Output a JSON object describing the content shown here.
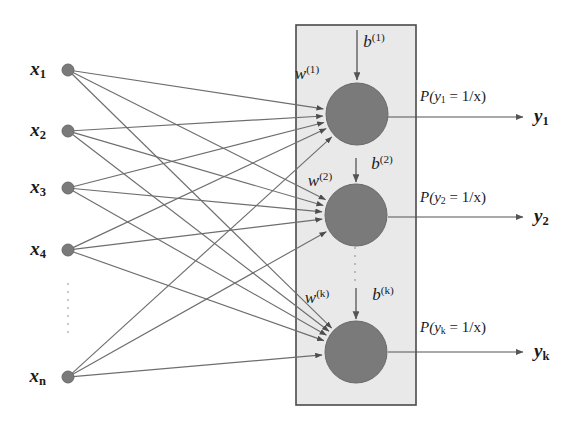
{
  "figure": {
    "background_color": "#ffffff",
    "edge_color": "#6e6e6e",
    "node_color": "#7a7a7a",
    "neuron_color": "#7a7a7a",
    "panel_fill": "#e9e9e9",
    "panel_border": "#4a4a4a",
    "text_color": "#1a1a1a"
  },
  "inputs": {
    "nodes": [
      {
        "label_main": "x",
        "label_sub": "1",
        "cx": 68,
        "cy": 70,
        "label_x": 46,
        "label_y": 70
      },
      {
        "label_main": "x",
        "label_sub": "2",
        "cx": 68,
        "cy": 131,
        "label_x": 46,
        "label_y": 131
      },
      {
        "label_main": "x",
        "label_sub": "3",
        "cx": 68,
        "cy": 188,
        "label_x": 46,
        "label_y": 188
      },
      {
        "label_main": "x",
        "label_sub": "4",
        "cx": 68,
        "cy": 250,
        "label_x": 46,
        "label_y": 250
      },
      {
        "label_main": "x",
        "label_sub": "n",
        "cx": 68,
        "cy": 377,
        "label_x": 46,
        "label_y": 377
      }
    ],
    "ellipsis": {
      "x": 68,
      "y_start": 283,
      "y_end": 337
    },
    "node_radius": 6
  },
  "hidden_layer": {
    "panel": {
      "x": 296,
      "y": 25,
      "width": 120,
      "height": 380
    },
    "neuron_radius": 31,
    "neurons": [
      {
        "cx": 357,
        "cy": 114,
        "weight_label_main": "w",
        "weight_label_sup": "(1)",
        "weight_x": 307,
        "weight_y": 73,
        "bias_label_main": "b",
        "bias_label_sup": "(1)",
        "bias_x": 374,
        "bias_y": 41,
        "bias_arrow_y_start": 30,
        "bias_arrow_y_end": 80
      },
      {
        "cx": 356,
        "cy": 215,
        "weight_label_main": "w",
        "weight_label_sup": "(2)",
        "weight_x": 320,
        "weight_y": 180,
        "bias_label_main": "b",
        "bias_label_sup": "(2)",
        "bias_x": 382,
        "bias_y": 163,
        "bias_arrow_y_start": 158,
        "bias_arrow_y_end": 182
      },
      {
        "cx": 356,
        "cy": 352,
        "weight_label_main": "w",
        "weight_label_sup": "(k)",
        "weight_x": 317,
        "weight_y": 297,
        "bias_label_main": "b",
        "bias_label_sup": "(k)",
        "bias_x": 383,
        "bias_y": 294,
        "bias_arrow_y_start": 288,
        "bias_arrow_y_end": 319
      }
    ],
    "neuron_ellipsis": {
      "x": 355,
      "y_start": 247,
      "y_end": 285
    }
  },
  "outputs": [
    {
      "prob_text_pre": "P(",
      "prob_var": "y",
      "prob_sub": "1",
      "prob_text_post": " = 1/x)",
      "prob_x": 420,
      "prob_y": 97,
      "arrow_x_start": 388,
      "arrow_x_end": 523,
      "arrow_y": 117,
      "out_label_main": "y",
      "out_label_sub": "1",
      "out_x": 534,
      "out_y": 117
    },
    {
      "prob_text_pre": "P(",
      "prob_var": "y",
      "prob_sub": "2",
      "prob_text_post": " = 1/x)",
      "prob_x": 420,
      "prob_y": 198,
      "arrow_x_start": 388,
      "arrow_x_end": 523,
      "arrow_y": 217,
      "out_label_main": "y",
      "out_label_sub": "2",
      "out_x": 534,
      "out_y": 217
    },
    {
      "prob_text_pre": "P(",
      "prob_var": "y",
      "prob_sub": "k",
      "prob_text_post": " = 1/x)",
      "prob_x": 420,
      "prob_y": 328,
      "arrow_x_start": 388,
      "arrow_x_end": 523,
      "arrow_y": 352,
      "out_label_main": "y",
      "out_label_sub": "k",
      "out_x": 534,
      "out_y": 352
    }
  ],
  "edges": [
    {
      "from": 0,
      "to": 0
    },
    {
      "from": 0,
      "to": 1
    },
    {
      "from": 0,
      "to": 2
    },
    {
      "from": 1,
      "to": 0
    },
    {
      "from": 1,
      "to": 1
    },
    {
      "from": 1,
      "to": 2
    },
    {
      "from": 2,
      "to": 0
    },
    {
      "from": 2,
      "to": 1
    },
    {
      "from": 2,
      "to": 2
    },
    {
      "from": 3,
      "to": 0
    },
    {
      "from": 3,
      "to": 1
    },
    {
      "from": 3,
      "to": 2
    },
    {
      "from": 4,
      "to": 0
    },
    {
      "from": 4,
      "to": 1
    },
    {
      "from": 4,
      "to": 2
    }
  ]
}
